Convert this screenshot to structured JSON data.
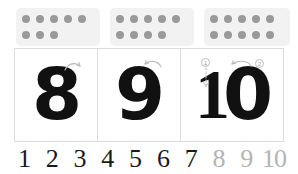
{
  "worksheet": {
    "title": "Number writing practice 8 9 10",
    "colors": {
      "dot_card_background": "#f2f2f2",
      "dot_fill": "#9a9a9a",
      "card_border": "#dcdcdc",
      "numeral_ink": "#111111",
      "sequence_active": "#1a1a1a",
      "sequence_dim": "#b4b4b4",
      "page_background": "#ffffff"
    }
  },
  "dot_cards": [
    {
      "name": "dot-card-8",
      "total": 8,
      "rows": [
        {
          "count": 5
        },
        {
          "count": 3
        }
      ]
    },
    {
      "name": "dot-card-9",
      "total": 9,
      "rows": [
        {
          "count": 5
        },
        {
          "count": 4
        }
      ]
    },
    {
      "name": "dot-card-10",
      "total": 10,
      "rows": [
        {
          "count": 5
        },
        {
          "count": 5
        }
      ]
    }
  ],
  "numeral_cards": [
    {
      "name": "numeral-card-8",
      "value": "8",
      "glyph": "8",
      "stroke_marks": []
    },
    {
      "name": "numeral-card-9",
      "value": "9",
      "glyph": "9",
      "stroke_marks": []
    },
    {
      "name": "numeral-card-10",
      "value": "10",
      "glyph_first": "1",
      "glyph_second": "0",
      "stroke_marks": [
        {
          "label": "1",
          "for": "one"
        },
        {
          "label": "2",
          "for": "zero"
        }
      ]
    }
  ],
  "sequence": [
    {
      "label": "1",
      "dim": false
    },
    {
      "label": "2",
      "dim": false
    },
    {
      "label": "3",
      "dim": false
    },
    {
      "label": "4",
      "dim": false
    },
    {
      "label": "5",
      "dim": false
    },
    {
      "label": "6",
      "dim": false
    },
    {
      "label": "7",
      "dim": false
    },
    {
      "label": "8",
      "dim": true
    },
    {
      "label": "9",
      "dim": true
    },
    {
      "label": "10",
      "dim": true
    }
  ]
}
